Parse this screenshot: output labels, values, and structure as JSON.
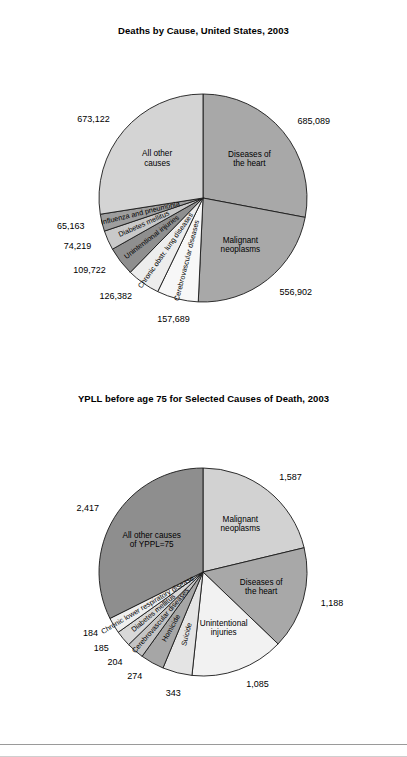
{
  "chart_data": [
    {
      "type": "pie",
      "title": "Deaths by Cause, United States, 2003",
      "id": "deaths-by-cause",
      "center": {
        "x": 203,
        "y": 198
      },
      "radius": 104,
      "start_angle_deg": -90,
      "direction": "clockwise",
      "total": 2448288,
      "legend": "none",
      "slices": [
        {
          "label": "Diseases of\nthe heart",
          "label_flat": "Diseases of the heart",
          "value": 685089,
          "value_text": "685,089",
          "color": "#a8a8a8",
          "label_style": "horizontal",
          "value_pos": "right"
        },
        {
          "label": "Malignant\nneoplasms",
          "label_flat": "Malignant neoplasms",
          "value": 556902,
          "value_text": "556,902",
          "color": "#a8a8a8",
          "label_style": "horizontal",
          "value_pos": "right"
        },
        {
          "label": "Cerebrovascular diseases",
          "label_flat": "Cerebrovascular diseases",
          "value": 157689,
          "value_text": "157,689",
          "color": "#f7f7f7",
          "label_style": "radial",
          "value_pos": "outer"
        },
        {
          "label": "Chronic obstr. lung diseases",
          "label_flat": "Chronic obstr. lung diseases",
          "value": 126382,
          "value_text": "126,382",
          "color": "#ededed",
          "label_style": "radial",
          "value_pos": "outer"
        },
        {
          "label": "Unintentional injuries",
          "label_flat": "Unintentional injuries",
          "value": 109722,
          "value_text": "109,722",
          "color": "#8f8f8f",
          "label_style": "radial",
          "value_pos": "outer"
        },
        {
          "label": "Diabetes mellitus",
          "label_flat": "Diabetes mellitus",
          "value": 74219,
          "value_text": "74,219",
          "color": "#c9c9c9",
          "label_style": "radial",
          "value_pos": "outer"
        },
        {
          "label": "Influenza and pneumonia",
          "label_flat": "Influenza and pneumonia",
          "value": 65163,
          "value_text": "65,163",
          "color": "#9e9e9e",
          "label_style": "radial",
          "value_pos": "outer"
        },
        {
          "label": "All other\ncauses",
          "label_flat": "All other causes",
          "value": 673122,
          "value_text": "673,122",
          "color": "#d4d4d4",
          "label_style": "horizontal",
          "value_pos": "left"
        }
      ]
    },
    {
      "type": "pie",
      "title": "YPLL before age 75 for Selected Causes of Death, 2003",
      "id": "ypll-before-75",
      "center": {
        "x": 203,
        "y": 572
      },
      "radius": 104,
      "start_angle_deg": -90,
      "direction": "clockwise",
      "total": 7267,
      "legend": "none",
      "slices": [
        {
          "label": "Malignant\nneoplasms",
          "label_flat": "Malignant neoplasms",
          "value": 1587,
          "value_text": "1,587",
          "color": "#d2d2d2",
          "label_style": "horizontal",
          "value_pos": "right"
        },
        {
          "label": "Diseases of\nthe heart",
          "label_flat": "Diseases of the heart",
          "value": 1188,
          "value_text": "1,188",
          "color": "#a8a8a8",
          "label_style": "horizontal",
          "value_pos": "right"
        },
        {
          "label": "Unintentional\ninjuries",
          "label_flat": "Unintentional injuries",
          "value": 1085,
          "value_text": "1,085",
          "color": "#f2f2f2",
          "label_style": "horizontal",
          "value_pos": "outer"
        },
        {
          "label": "Suicide",
          "label_flat": "Suicide",
          "value": 343,
          "value_text": "343",
          "color": "#e4e4e4",
          "label_style": "radial",
          "value_pos": "outer"
        },
        {
          "label": "Homicide",
          "label_flat": "Homicide",
          "value": 274,
          "value_text": "274",
          "color": "#a6a6a6",
          "label_style": "radial",
          "value_pos": "outer"
        },
        {
          "label": "Cerebrovascular diseases",
          "label_flat": "Cerebrovascular diseases",
          "value": 204,
          "value_text": "204",
          "color": "#c4c4c4",
          "label_style": "radial",
          "value_pos": "outer"
        },
        {
          "label": "Diabetes mellitus",
          "label_flat": "Diabetes mellitus",
          "value": 185,
          "value_text": "185",
          "color": "#d8d8d8",
          "label_style": "radial",
          "value_pos": "outer"
        },
        {
          "label": "Chronic lower respiratory disease",
          "label_flat": "Chronic lower respiratory disease",
          "value": 184,
          "value_text": "184",
          "color": "#efefef",
          "label_style": "radial",
          "value_pos": "outer"
        },
        {
          "label": "All other causes\nof YPPL=75",
          "label_flat": "All other causes of YPPL=75",
          "value": 2417,
          "value_text": "2,417",
          "color": "#8e8e8e",
          "label_style": "horizontal",
          "value_pos": "left"
        }
      ]
    }
  ],
  "charts": {
    "chart1": {
      "title": "Deaths by Cause, United States, 2003"
    },
    "chart2": {
      "title": "YPLL before age 75 for Selected Causes of Death, 2003"
    }
  }
}
